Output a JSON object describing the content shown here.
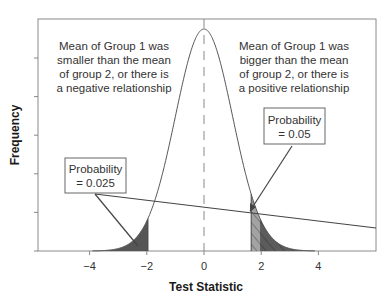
{
  "chart_data": {
    "type": "area",
    "title": "",
    "xlabel": "Test Statistic",
    "ylabel": "Frequency",
    "xlim": [
      -5.8,
      6.0
    ],
    "x_ticks": [
      -4,
      -2,
      0,
      2,
      4
    ],
    "x_tick_labels": [
      "−4",
      "−2",
      "0",
      "2",
      "4"
    ],
    "y_ticks_count": 6,
    "y_tick_labels": [],
    "grid": false,
    "legend": null,
    "curve": {
      "name": "Standard normal distribution",
      "mean": 0,
      "sd": 1
    },
    "center_line": {
      "x": 0,
      "style": "dashed"
    },
    "shaded_regions": [
      {
        "name": "left-tail",
        "from": -5.8,
        "to": -1.96,
        "probability": 0.025,
        "fill": "#555555",
        "pattern": "solid"
      },
      {
        "name": "right-tail-one-sided",
        "from": 1.65,
        "to": 6.0,
        "probability": 0.05,
        "fill": "#9a9a9a",
        "pattern": "hatched"
      },
      {
        "name": "right-tail-two-sided",
        "from": 1.96,
        "to": 6.0,
        "probability": 0.025,
        "fill": "#555555",
        "pattern": "cross-hatched"
      }
    ],
    "annotations": [
      {
        "name": "negative-note",
        "lines": [
          "Mean of Group 1 was",
          "smaller than the mean",
          "of group 2, or there is",
          "a negative relationship"
        ]
      },
      {
        "name": "positive-note",
        "lines": [
          "Mean of Group 1 was",
          "bigger than the mean",
          "of group 2, or there is",
          "a positive relationship"
        ]
      },
      {
        "name": "prob-box-left",
        "lines": [
          "Probability",
          "= 0.025"
        ],
        "points_to": [
          "left-tail",
          "right-tail-two-sided"
        ]
      },
      {
        "name": "prob-box-right",
        "lines": [
          "Probability",
          "= 0.05"
        ],
        "points_to": [
          "right-tail-one-sided"
        ]
      }
    ]
  },
  "colors": {
    "frame": "#7a7a7a",
    "curve": "#555555",
    "dark_fill": "#555555",
    "light_fill": "#a0a0a0",
    "text": "#333333"
  }
}
